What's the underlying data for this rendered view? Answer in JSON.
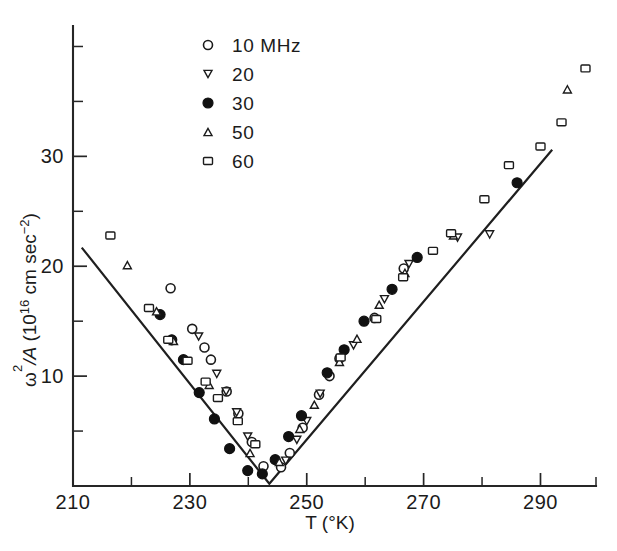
{
  "chart_data": {
    "type": "scatter",
    "title": "",
    "xlabel": "T (°K)",
    "ylabel": "ω²/A (10¹⁶ cm sec⁻²)",
    "ylabel_parts": {
      "omega": "ω",
      "omega_exp": "2",
      "slash_a": "/A",
      "paren_open": " (10",
      "scale_exp": "16",
      "units": " cm sec",
      "units_exp": "−2",
      "paren_close": ")"
    },
    "xlim": [
      210,
      299.5
    ],
    "ylim": [
      0,
      41.5
    ],
    "xticks_major": [
      210,
      230,
      250,
      270,
      290
    ],
    "xticks_major_labels": [
      "210",
      "230",
      "250",
      "270",
      "290"
    ],
    "xticks_minor": [
      220,
      240,
      260,
      280
    ],
    "yticks_major": [
      10,
      20,
      30
    ],
    "yticks_major_labels": [
      "10",
      "20",
      "30"
    ],
    "yticks_minor": [
      5,
      15,
      25,
      35,
      40
    ],
    "grid": false,
    "legend_position": "top-center",
    "fit_line": {
      "label": "",
      "vertex": [
        243.6,
        0.2
      ],
      "left_end": [
        211.5,
        21.7
      ],
      "right_end": [
        292.0,
        30.6
      ]
    },
    "series": [
      {
        "name": "10 MHz",
        "legend_label": "10 MHz",
        "marker": "open-circle",
        "marker_size": 9,
        "points": [
          [
            226.7,
            18.0
          ],
          [
            230.4,
            14.3
          ],
          [
            232.5,
            12.6
          ],
          [
            233.6,
            11.5
          ],
          [
            236.3,
            8.6
          ],
          [
            238.3,
            6.6
          ],
          [
            240.6,
            4.0
          ],
          [
            242.6,
            1.8
          ],
          [
            245.6,
            1.7
          ],
          [
            247.1,
            3.0
          ],
          [
            249.3,
            5.3
          ],
          [
            252.1,
            8.3
          ],
          [
            253.9,
            10.0
          ],
          [
            255.6,
            11.6
          ],
          [
            261.6,
            15.3
          ],
          [
            266.6,
            19.8
          ]
        ]
      },
      {
        "name": "20 MHz",
        "legend_label": "20",
        "marker": "down-triangle",
        "marker_size": 8,
        "points": [
          [
            231.5,
            13.6
          ],
          [
            234.6,
            10.2
          ],
          [
            236.2,
            8.6
          ],
          [
            238.0,
            6.7
          ],
          [
            239.9,
            4.5
          ],
          [
            246.4,
            2.3
          ],
          [
            248.3,
            4.2
          ],
          [
            250.0,
            5.9
          ],
          [
            252.3,
            8.4
          ],
          [
            258.0,
            12.8
          ],
          [
            263.3,
            17.0
          ],
          [
            267.5,
            20.2
          ],
          [
            275.8,
            22.6
          ],
          [
            281.3,
            22.9
          ]
        ]
      },
      {
        "name": "30 MHz",
        "legend_label": "30",
        "marker": "filled-circle",
        "marker_size": 10,
        "points": [
          [
            224.9,
            15.6
          ],
          [
            226.9,
            13.3
          ],
          [
            228.9,
            11.5
          ],
          [
            231.6,
            8.5
          ],
          [
            234.2,
            6.1
          ],
          [
            236.8,
            3.4
          ],
          [
            239.9,
            1.4
          ],
          [
            242.4,
            1.1
          ],
          [
            244.6,
            2.4
          ],
          [
            246.9,
            4.5
          ],
          [
            249.1,
            6.4
          ],
          [
            253.5,
            10.3
          ],
          [
            256.4,
            12.4
          ],
          [
            259.8,
            15.0
          ],
          [
            264.6,
            17.9
          ],
          [
            268.9,
            20.8
          ],
          [
            286.0,
            27.6
          ]
        ]
      },
      {
        "name": "50 MHz",
        "legend_label": "50",
        "marker": "up-triangle",
        "marker_size": 8,
        "points": [
          [
            219.3,
            20.1
          ],
          [
            224.3,
            15.9
          ],
          [
            227.2,
            13.2
          ],
          [
            233.3,
            9.2
          ],
          [
            240.3,
            3.0
          ],
          [
            245.3,
            2.2
          ],
          [
            248.8,
            5.2
          ],
          [
            251.3,
            7.4
          ],
          [
            255.6,
            11.3
          ],
          [
            258.6,
            13.4
          ],
          [
            262.4,
            16.5
          ],
          [
            266.8,
            19.4
          ],
          [
            275.1,
            22.8
          ],
          [
            294.6,
            36.1
          ]
        ]
      },
      {
        "name": "60 MHz",
        "legend_label": "60",
        "marker": "open-square",
        "marker_size": 9,
        "points": [
          [
            216.4,
            22.8
          ],
          [
            223.0,
            16.2
          ],
          [
            226.3,
            13.3
          ],
          [
            229.6,
            11.4
          ],
          [
            232.7,
            9.5
          ],
          [
            234.8,
            8.0
          ],
          [
            238.2,
            5.9
          ],
          [
            241.2,
            3.8
          ],
          [
            255.8,
            11.7
          ],
          [
            261.9,
            15.2
          ],
          [
            266.5,
            19.0
          ],
          [
            271.6,
            21.4
          ],
          [
            274.7,
            23.0
          ],
          [
            280.4,
            26.1
          ],
          [
            284.6,
            29.2
          ],
          [
            290.0,
            30.9
          ],
          [
            293.6,
            33.1
          ],
          [
            297.7,
            38.0
          ]
        ]
      }
    ]
  },
  "legend": {
    "entries": [
      {
        "label": "10 MHz",
        "marker": "open-circle"
      },
      {
        "label": "20",
        "marker": "down-triangle"
      },
      {
        "label": "30",
        "marker": "filled-circle"
      },
      {
        "label": "50",
        "marker": "up-triangle"
      },
      {
        "label": "60",
        "marker": "open-square"
      }
    ]
  }
}
